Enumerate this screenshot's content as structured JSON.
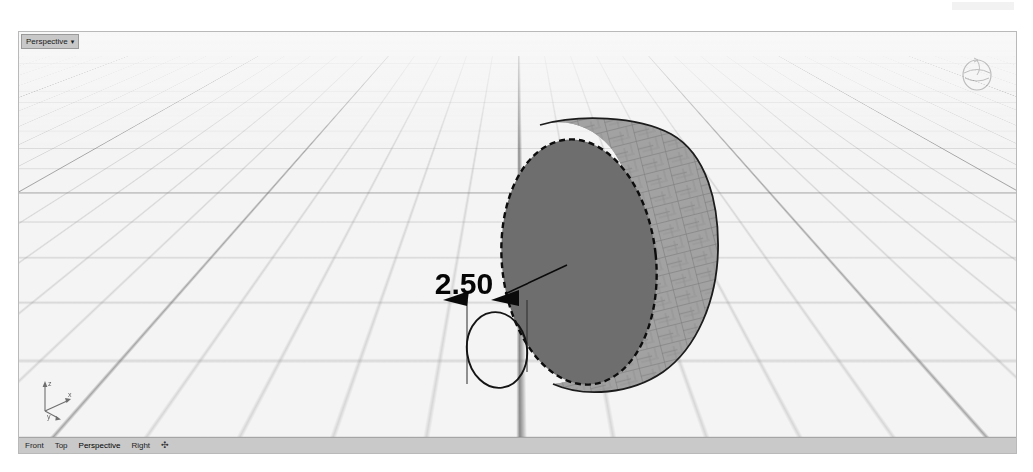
{
  "app": {
    "viewport_label": "Perspective",
    "viewport_caret": "▾"
  },
  "viewport": {
    "title": "Perspective",
    "nav_gizmo_name": "rotate-gizmo",
    "axes": {
      "x_label": "x",
      "y_label": "y",
      "z_label": "z"
    }
  },
  "annotation": {
    "dimension_value": "2.50"
  },
  "tabs": [
    {
      "label": "Front",
      "active": false
    },
    {
      "label": "Top",
      "active": false
    },
    {
      "label": "Perspective",
      "active": true
    },
    {
      "label": "Right",
      "active": false
    }
  ],
  "add_tab_label": "✣",
  "colors": {
    "viewport_background": "#f7f7f7",
    "grid_line": "#7d7d7d",
    "grid_minor": "#969696",
    "axis_line": "#3c3c3c",
    "object_face": "#6e6e6e",
    "object_side": "#9a9a9a",
    "selection_outline": "#111111",
    "annotation": "#000000",
    "tabstrip_background": "#c9c9c9",
    "title_background": "#c8c8c8"
  }
}
